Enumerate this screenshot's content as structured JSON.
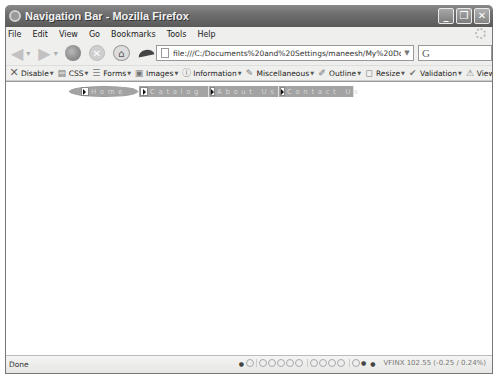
{
  "window": {
    "title": "Navigation Bar - Mozilla Firefox",
    "controls": {
      "minimize": "_",
      "maximize": "❐",
      "close": "✕"
    }
  },
  "menubar": {
    "items": [
      {
        "label": "File",
        "accel": "F"
      },
      {
        "label": "Edit",
        "accel": "E"
      },
      {
        "label": "View",
        "accel": "V"
      },
      {
        "label": "Go",
        "accel": "G"
      },
      {
        "label": "Bookmarks",
        "accel": "B"
      },
      {
        "label": "Tools",
        "accel": "T"
      },
      {
        "label": "Help",
        "accel": "H"
      }
    ]
  },
  "navbar": {
    "back_icon": "◀",
    "forward_icon": "▶",
    "dropdown_icon": "▾",
    "stop_icon": "✕",
    "home_icon": "⌂",
    "url": "file:///C:/Documents%20and%20Settings/maneesh/My%20Documents/Index",
    "url_dropdown_icon": "▼",
    "search_engine_icon": "G",
    "search_value": ""
  },
  "devtoolbar": {
    "items": [
      {
        "label": "Disable",
        "icon": "✕",
        "has_menu": true
      },
      {
        "label": "CSS",
        "icon": "▤",
        "has_menu": true
      },
      {
        "label": "Forms",
        "icon": "☰",
        "has_menu": true
      },
      {
        "label": "Images",
        "icon": "▣",
        "has_menu": true
      },
      {
        "label": "Information",
        "icon": "ⓘ",
        "has_menu": true
      },
      {
        "label": "Miscellaneous",
        "icon": "✎",
        "has_menu": true
      },
      {
        "label": "Outline",
        "icon": "✐",
        "has_menu": true
      },
      {
        "label": "Resize",
        "icon": "◻",
        "has_menu": true
      },
      {
        "label": "Validation",
        "icon": "✔",
        "has_menu": true
      },
      {
        "label": "View Source",
        "icon": "⚠",
        "has_menu": false
      },
      {
        "label": "Options",
        "icon": "⚙",
        "has_menu": true
      }
    ],
    "caret": "▼"
  },
  "page": {
    "nav_items": [
      {
        "label": "Home"
      },
      {
        "label": "Catalog"
      },
      {
        "label": "About Us"
      },
      {
        "label": "Contact Us"
      }
    ],
    "colors": {
      "nav_bg": "#a3a3a3",
      "nav_text": "#d6d6d6"
    }
  },
  "statusbar": {
    "text": "Done",
    "stock_value": "VFINX 102.55 (-0.25 / 0.24%)"
  }
}
